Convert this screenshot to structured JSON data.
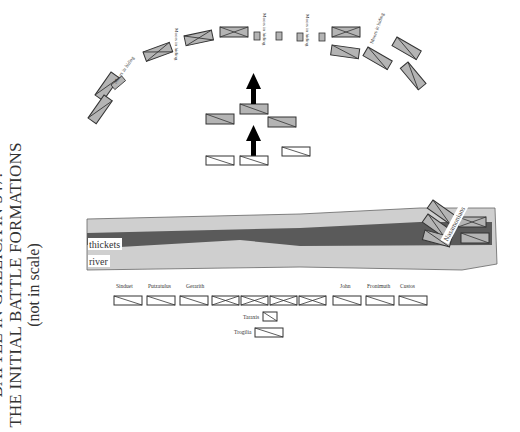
{
  "title": {
    "line1": "BATTLE IN GALLICA IN 547:",
    "line2": "THE INITIAL BATTLE FORMATIONS",
    "line3": "(not in scale)"
  },
  "terrain": {
    "thickets_label": "thickets",
    "river_label": "river"
  },
  "colors": {
    "unit_fill": "#b4b4b4",
    "unit_stroke": "#333333",
    "allied_fill": "#ffffff",
    "river_light": "#cfcfcf",
    "thickets_dark": "#5a5a5a",
    "arrow": "#000000"
  },
  "ambush_labels": {
    "a1": "Moors in hiding",
    "a2": "Moors in hiding",
    "a3": "Moors in hiding",
    "a4": "Moors in hiding",
    "a5": "Moors in hiding"
  },
  "river_unit_label": "Nasamonians",
  "commanders": {
    "c1": "Sinduet",
    "c2": "Putzatulus",
    "c3": "Gerarith",
    "c4": "John",
    "c5": "Fronimuth",
    "c6": "Custos",
    "c7": "Taraxis",
    "c8": "Trogilia"
  }
}
